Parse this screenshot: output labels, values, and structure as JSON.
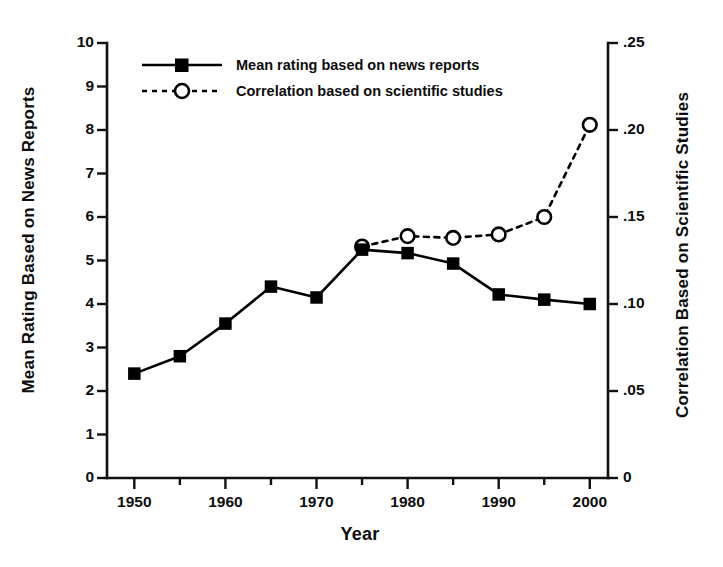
{
  "chart_data": {
    "type": "line",
    "title": "",
    "xlabel": "Year",
    "ylabel": "Mean Rating Based on News Reports",
    "ylabel_right": "Correlation Based on Scientific Studies",
    "x": [
      1950,
      1955,
      1960,
      1965,
      1970,
      1975,
      1980,
      1985,
      1990,
      1995,
      2000
    ],
    "xlim": [
      1947,
      2002
    ],
    "ylim": [
      0,
      10
    ],
    "ylim_right": [
      0,
      0.25
    ],
    "grid": false,
    "legend_position": "top-left-inside",
    "xticks_major": [
      "1950",
      "1960",
      "1970",
      "1980",
      "1990",
      "2000"
    ],
    "xticks_major_values": [
      1950,
      1960,
      1970,
      1980,
      1990,
      2000
    ],
    "xticks_minor_values": [
      1955,
      1965,
      1975,
      1985,
      1995
    ],
    "yticks_left": [
      "0",
      "1",
      "2",
      "3",
      "4",
      "5",
      "6",
      "7",
      "8",
      "9",
      "10"
    ],
    "yticks_left_values": [
      0,
      1,
      2,
      3,
      4,
      5,
      6,
      7,
      8,
      9,
      10
    ],
    "yticks_right": [
      "0",
      ".05",
      ".10",
      ".15",
      ".20",
      ".25"
    ],
    "yticks_right_values": [
      0,
      0.05,
      0.1,
      0.15,
      0.2,
      0.25
    ],
    "series": [
      {
        "name": "Mean rating based on news reports",
        "axis": "left",
        "marker": "filled-square",
        "linestyle": "solid",
        "color": "#000000",
        "x": [
          1950,
          1955,
          1960,
          1965,
          1970,
          1975,
          1980,
          1985,
          1990,
          1995,
          2000
        ],
        "values": [
          2.4,
          2.8,
          3.55,
          4.4,
          4.15,
          5.25,
          5.17,
          4.93,
          4.22,
          4.1,
          4.0
        ]
      },
      {
        "name": "Correlation based on scientific studies",
        "axis": "right",
        "marker": "open-circle",
        "linestyle": "dashed",
        "color": "#000000",
        "x": [
          1975,
          1980,
          1985,
          1990,
          1995,
          2000
        ],
        "values": [
          0.133,
          0.139,
          0.138,
          0.14,
          0.15,
          0.203
        ]
      }
    ]
  },
  "legend": {
    "items": [
      {
        "label": "Mean rating based on news reports",
        "marker": "filled-square",
        "linestyle": "solid"
      },
      {
        "label": "Correlation based on scientific studies",
        "marker": "open-circle",
        "linestyle": "dashed"
      }
    ]
  },
  "axes": {
    "x_title": "Year",
    "y_left_title": "Mean Rating Based on News Reports",
    "y_right_title": "Correlation Based on Scientific Studies"
  },
  "colors": {
    "ink": "#0d0d0d",
    "background": "#ffffff",
    "series": "#000000"
  }
}
